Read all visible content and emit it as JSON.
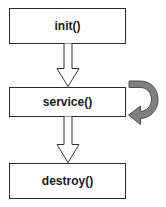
{
  "diagram": {
    "type": "flowchart",
    "background_color": "#ffffff",
    "node_fill_color": "#ffffff",
    "node_border_color": "#2b2b2b",
    "arrow_fill_color": "#ffffff",
    "arrow_stroke_color": "#333333",
    "loop_arrow_color": "#808080",
    "loop_arrow_stroke_color": "#4d4d4d",
    "text_color": "#1a1a1a",
    "nodes": [
      {
        "id": "init",
        "label": "init()"
      },
      {
        "id": "service",
        "label": "service()"
      },
      {
        "id": "destroy",
        "label": "destroy()"
      }
    ],
    "edges": [
      {
        "id": "init-to-service",
        "from": "init",
        "to": "service",
        "style": "block-arrow-down",
        "label": ""
      },
      {
        "id": "service-to-destroy",
        "from": "service",
        "to": "destroy",
        "style": "block-arrow-down",
        "label": ""
      },
      {
        "id": "service-self-loop",
        "from": "service",
        "to": "service",
        "style": "curved-loop-arrow",
        "label": ""
      }
    ]
  }
}
